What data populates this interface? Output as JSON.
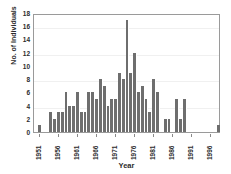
{
  "chart_data": {
    "type": "bar",
    "title": "",
    "xlabel": "Year",
    "ylabel": "No. of Individuals",
    "ylim": [
      0,
      18
    ],
    "ytick_step": 2,
    "yticks": [
      0,
      2,
      4,
      6,
      8,
      10,
      12,
      14,
      16,
      18
    ],
    "xlim": [
      1950,
      1999
    ],
    "xticks": [
      1951,
      1956,
      1961,
      1966,
      1971,
      1976,
      1981,
      1986,
      1991,
      1996
    ],
    "grid": false,
    "legend": null,
    "bar_color": "#6e6e6e",
    "categories": [
      1951,
      1952,
      1953,
      1954,
      1955,
      1956,
      1957,
      1958,
      1959,
      1960,
      1961,
      1962,
      1963,
      1964,
      1965,
      1966,
      1967,
      1968,
      1969,
      1970,
      1971,
      1972,
      1973,
      1974,
      1975,
      1976,
      1977,
      1978,
      1979,
      1980,
      1981,
      1982,
      1983,
      1984,
      1985,
      1986,
      1987,
      1988,
      1989,
      1990,
      1991,
      1992,
      1993,
      1994,
      1995,
      1996,
      1997,
      1998
    ],
    "values": [
      1,
      0,
      0,
      3,
      2,
      3,
      3,
      6,
      4,
      4,
      6,
      3,
      3,
      6,
      6,
      5,
      8,
      7,
      4,
      5,
      5,
      9,
      8,
      17,
      9,
      12,
      6,
      7,
      5,
      3,
      8,
      6,
      0,
      2,
      2,
      0,
      5,
      2,
      5,
      0,
      0,
      0,
      0,
      0,
      0,
      0,
      0,
      1
    ]
  }
}
